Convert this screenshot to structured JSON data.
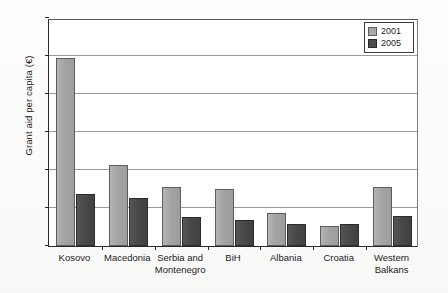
{
  "chart_data": {
    "type": "bar",
    "title": "",
    "subtitle": "",
    "xlabel": "",
    "ylabel": "Grant aid per capita (€)",
    "ylim": [
      0,
      300
    ],
    "yticks": [
      0,
      50,
      100,
      150,
      200,
      250,
      300
    ],
    "ytick_labels": [
      "0",
      "50",
      "100",
      "150",
      "200",
      "250",
      "300"
    ],
    "grid": true,
    "legend_position": "top-right",
    "categories": [
      "Kosovo",
      "Macedonia",
      "Serbia and\nMontenegro",
      "BiH",
      "Albania",
      "Croatia",
      "Western\nBalkans"
    ],
    "series": [
      {
        "name": "2001",
        "color": "#a9a9a9",
        "values": [
          248,
          106,
          77,
          75,
          43,
          26,
          77
        ]
      },
      {
        "name": "2005",
        "color": "#4b4b4b",
        "values": [
          68,
          63,
          38,
          34,
          29,
          29,
          39
        ]
      }
    ]
  },
  "legend": {
    "entries": [
      {
        "label": "2001",
        "swatch": "light-gray-swatch"
      },
      {
        "label": "2005",
        "swatch": "dark-gray-swatch"
      }
    ]
  },
  "colors": {
    "series_2001": "#a9a9a9",
    "series_2005": "#4b4b4b",
    "axis": "#2a2a2a",
    "gridline": "#9a9a9a",
    "background": "#ffffff",
    "text": "#1c1c1c"
  }
}
